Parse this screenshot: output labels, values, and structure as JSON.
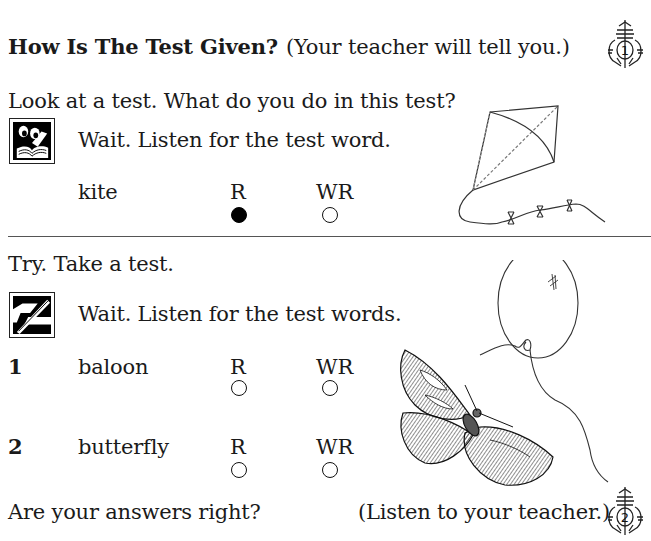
{
  "header": {
    "title": "How Is The Test Given?",
    "instruction": "(Your teacher will tell you.)",
    "step_badge": "1"
  },
  "intro": {
    "question": "Look at a test.  What do you do in this test?",
    "icon": "reading-book-icon",
    "prompt": "Wait.  Listen for the test word."
  },
  "example": {
    "word": "kite",
    "options": [
      {
        "label": "R",
        "selected": true
      },
      {
        "label": "WR",
        "selected": false
      }
    ],
    "illustration": "kite-illustration"
  },
  "practice": {
    "heading": "Try.  Take a test.",
    "icon": "pencil-writing-icon",
    "prompt": "Wait.  Listen for the test words.",
    "items": [
      {
        "number": "1",
        "word": "baloon",
        "options": [
          {
            "label": "R",
            "selected": false
          },
          {
            "label": "WR",
            "selected": false
          }
        ]
      },
      {
        "number": "2",
        "word": "butterfly",
        "options": [
          {
            "label": "R",
            "selected": false
          },
          {
            "label": "WR",
            "selected": false
          }
        ]
      }
    ],
    "illustrations": [
      "balloon-illustration",
      "butterfly-illustration"
    ]
  },
  "footer": {
    "question": "Are your answers right?",
    "instruction": "(Listen to your teacher.)",
    "step_badge": "2"
  }
}
